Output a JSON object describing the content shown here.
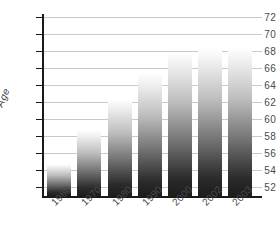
{
  "chart_data": {
    "type": "bar",
    "title": "",
    "subtitle": "",
    "xlabel": "",
    "ylabel": "Age",
    "categories": [
      "1960",
      "1970",
      "1980",
      "1990",
      "2000",
      "2002",
      "2003"
    ],
    "values": [
      54.7,
      58.8,
      62.4,
      65.4,
      67.9,
      68.4,
      68.5
    ],
    "series": [
      {
        "name": "Age",
        "values": [
          54.7,
          58.8,
          62.4,
          65.4,
          67.9,
          68.4,
          68.5
        ]
      }
    ],
    "ylim": [
      51,
      72
    ],
    "yticks": [
      52,
      54,
      56,
      58,
      60,
      62,
      64,
      66,
      68,
      70,
      72
    ],
    "ytick_labels": [
      "52",
      "54",
      "56",
      "58",
      "60",
      "62",
      "64",
      "66",
      "68",
      "70",
      "72"
    ],
    "grid": true,
    "grid_axis": "y",
    "legend": false,
    "legend_position": "none",
    "annotations": [],
    "colors": {
      "bar_gradient_top": "#ffffff",
      "bar_gradient_bottom": "#1c1c1c",
      "gridline": "#c9c9c9",
      "axis": "#1a1a1a",
      "tick_text": "#4a4a4a",
      "background": "#ffffff"
    }
  }
}
